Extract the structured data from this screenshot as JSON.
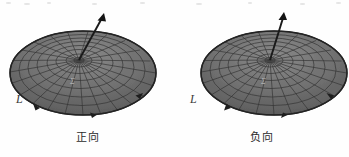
{
  "figure": {
    "title": "",
    "background_color": "#fefefe",
    "surface_fill": "#6e6e6e",
    "surface_stroke": "#2f2f2f",
    "arrow_color": "#1a1a1a",
    "text_color": "#2b2b2b"
  },
  "panels": [
    {
      "id": "positive",
      "caption": "正向",
      "curve_label": "L",
      "surface_label": "Σ",
      "normal_vector": {
        "label": "n",
        "direction": "up-right",
        "tip_x": 104,
        "tip_y": 14,
        "base_x": 79,
        "base_y": 60
      },
      "boundary_orientation": "counterclockwise"
    },
    {
      "id": "negative",
      "caption": "负向",
      "curve_label": "L",
      "surface_label": "Σ",
      "normal_vector": {
        "label": "n",
        "direction": "up",
        "tip_x": 110,
        "tip_y": 13,
        "base_x": 96,
        "base_y": 60
      },
      "boundary_orientation": "clockwise"
    }
  ],
  "mesh": {
    "radial_lines": 18,
    "ring_lines": 7,
    "shape": "dome"
  }
}
